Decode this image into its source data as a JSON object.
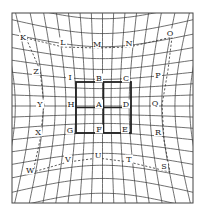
{
  "diagram": {
    "type": "distortion-grid",
    "frame": {
      "x": 12,
      "y": 13,
      "width": 181,
      "height": 190
    },
    "grid": {
      "columns": 20,
      "rows": 20,
      "stroke": "#333333"
    },
    "center_box": {
      "x": 76,
      "y": 82,
      "width": 55,
      "height": 51,
      "stroke": "#222222"
    },
    "dashed_loop": {
      "stroke": "#333333",
      "points": [
        [
          26,
          38
        ],
        [
          63,
          47
        ],
        [
          97,
          48
        ],
        [
          129,
          47
        ],
        [
          172,
          37
        ],
        [
          168,
          70
        ],
        [
          162,
          105
        ],
        [
          164,
          140
        ],
        [
          170,
          172
        ],
        [
          129,
          162
        ],
        [
          98,
          158
        ],
        [
          68,
          162
        ],
        [
          33,
          172
        ],
        [
          40,
          140
        ],
        [
          44,
          105
        ],
        [
          40,
          70
        ]
      ]
    },
    "labels": [
      {
        "text": "K",
        "x": 23,
        "y": 37
      },
      {
        "text": "L",
        "x": 63,
        "y": 42
      },
      {
        "text": "M",
        "x": 97,
        "y": 44
      },
      {
        "text": "N",
        "x": 129,
        "y": 43
      },
      {
        "text": "O",
        "x": 170,
        "y": 33
      },
      {
        "text": "Z",
        "x": 36,
        "y": 71
      },
      {
        "text": "I",
        "x": 70,
        "y": 77
      },
      {
        "text": "B",
        "x": 99,
        "y": 78
      },
      {
        "text": "C",
        "x": 126,
        "y": 78
      },
      {
        "text": "P",
        "x": 158,
        "y": 75
      },
      {
        "text": "Y",
        "x": 40,
        "y": 104
      },
      {
        "text": "H",
        "x": 71,
        "y": 104
      },
      {
        "text": "A",
        "x": 99,
        "y": 104
      },
      {
        "text": "D",
        "x": 126,
        "y": 104
      },
      {
        "text": "Q",
        "x": 155,
        "y": 103
      },
      {
        "text": "X",
        "x": 38,
        "y": 132
      },
      {
        "text": "G",
        "x": 70,
        "y": 130
      },
      {
        "text": "F",
        "x": 99,
        "y": 129
      },
      {
        "text": "E",
        "x": 125,
        "y": 129
      },
      {
        "text": "R",
        "x": 158,
        "y": 132
      },
      {
        "text": "W",
        "x": 30,
        "y": 170
      },
      {
        "text": "V",
        "x": 68,
        "y": 159
      },
      {
        "text": "U",
        "x": 98,
        "y": 155
      },
      {
        "text": "T",
        "x": 129,
        "y": 159
      },
      {
        "text": "S",
        "x": 164,
        "y": 166
      }
    ]
  }
}
